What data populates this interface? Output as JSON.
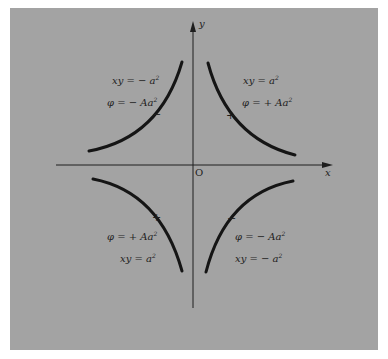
{
  "diagram": {
    "colors": {
      "background": "#a3a3a3",
      "ink": "#1e1e1e",
      "page": "#ffffff"
    },
    "axes": {
      "x_label": "x",
      "y_label": "y",
      "origin_label": "O"
    },
    "quadrants": {
      "top_left": {
        "equation": "xy = − a",
        "exponent": "2",
        "potential": "φ = − Aa",
        "potential_exponent": "2",
        "sign": "−"
      },
      "top_right": {
        "equation": "xy = a",
        "exponent": "2",
        "potential": "φ = + Aa",
        "potential_exponent": "2",
        "sign": "+"
      },
      "bottom_left": {
        "equation": "xy = a",
        "exponent": "2",
        "potential": "φ = + Aa",
        "potential_exponent": "2",
        "sign": "+"
      },
      "bottom_right": {
        "equation": "xy = − a",
        "exponent": "2",
        "potential": "φ = − Aa",
        "potential_exponent": "2",
        "sign": "−"
      }
    }
  }
}
